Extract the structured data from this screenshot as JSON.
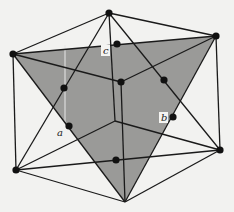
{
  "figure": {
    "colors": {
      "background": "#f2f2f0",
      "plane_fill": "#9a9a98",
      "edge": "#1a1a1a",
      "dot": "#111111",
      "artifact": "#e8e8e8"
    },
    "vertices": {
      "T": [
        109,
        13
      ],
      "LU": [
        13,
        54
      ],
      "RU": [
        216,
        36
      ],
      "LL": [
        16,
        170
      ],
      "RL": [
        220,
        150
      ],
      "B": [
        125,
        202
      ],
      "C": [
        121,
        82
      ],
      "H": [
        115,
        121
      ]
    },
    "plane": [
      "LU",
      "RU",
      "B"
    ],
    "edges": [
      [
        "T",
        "LU"
      ],
      [
        "T",
        "RU"
      ],
      [
        "LU",
        "LL"
      ],
      [
        "RU",
        "RL"
      ],
      [
        "LL",
        "B"
      ],
      [
        "RL",
        "B"
      ],
      [
        "LU",
        "C"
      ],
      [
        "RU",
        "C"
      ],
      [
        "C",
        "B"
      ],
      [
        "T",
        "H"
      ],
      [
        "LL",
        "H"
      ],
      [
        "RL",
        "H"
      ],
      [
        "T",
        "LL"
      ],
      [
        "T",
        "RL"
      ],
      [
        "LL",
        "RL"
      ],
      [
        "LU",
        "RU"
      ],
      [
        "LU",
        "B"
      ],
      [
        "RU",
        "B"
      ]
    ],
    "corner_dots": [
      "T",
      "LU",
      "RU",
      "LL",
      "RL",
      "B",
      "C"
    ],
    "face_dots": [
      {
        "id": "c",
        "pos": [
          117,
          44
        ]
      },
      {
        "id": "a-upper",
        "pos": [
          64,
          88
        ]
      },
      {
        "id": "a",
        "pos": [
          69,
          126
        ]
      },
      {
        "id": "b-upper",
        "pos": [
          164,
          80
        ]
      },
      {
        "id": "b",
        "pos": [
          173,
          117
        ]
      },
      {
        "id": "bottom",
        "pos": [
          116,
          160
        ]
      }
    ],
    "labels": {
      "a": {
        "text": "a",
        "pos": [
          57,
          136
        ],
        "boxed": false
      },
      "b": {
        "text": "b",
        "pos": [
          161,
          121
        ],
        "boxed": true
      },
      "c": {
        "text": "c",
        "pos": [
          103,
          54
        ],
        "boxed": true
      }
    }
  }
}
